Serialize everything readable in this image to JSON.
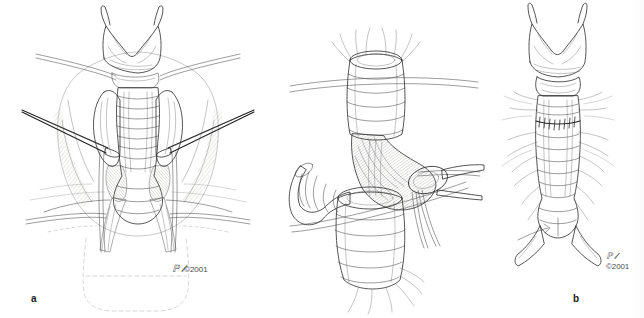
{
  "figure": {
    "kind": "medical-illustration-plate",
    "background_color": "#ffffff",
    "ink_color": "#2b2b2b",
    "panel_count": 3
  },
  "panels": [
    {
      "id": "a",
      "label": "a",
      "caption": "Exposure of the cervical trachea with thyroid isthmus divided and lobes retracted laterally; self-retaining retractors and strap muscles shown.",
      "signature": {
        "mark": "artist-signature",
        "year_text": "©2001"
      },
      "structures": [
        "thyroid-cartilage",
        "cricoid-cartilage",
        "tracheal-rings",
        "thyroid-lobe-left",
        "thyroid-lobe-right",
        "strap-muscles",
        "retractor-left",
        "retractor-right",
        "skin-flap-superior",
        "skin-flap-inferior"
      ]
    },
    {
      "id": "b",
      "label": "b",
      "caption": "Divided trachea with proximal and distal segments held on traction sutures; a clamp grasps the resected stenotic segment.",
      "signature": {
        "mark": "artist-signature",
        "year_text": "©2001"
      },
      "structures": [
        "proximal-tracheal-stump",
        "distal-tracheal-stump",
        "resected-segment",
        "surgical-clamp",
        "traction-suture-upper",
        "traction-suture-lower"
      ]
    },
    {
      "id": "c",
      "label": "c",
      "caption": "Completed end-to-end tracheal anastomosis with interrupted sutures in place.",
      "signature": {
        "mark": "artist-signature",
        "year_text": "©2001"
      },
      "structures": [
        "thyroid-cartilage",
        "cricoid-cartilage",
        "anastomosis-suture-line",
        "tracheal-rings",
        "carina-bifurcation"
      ]
    }
  ]
}
